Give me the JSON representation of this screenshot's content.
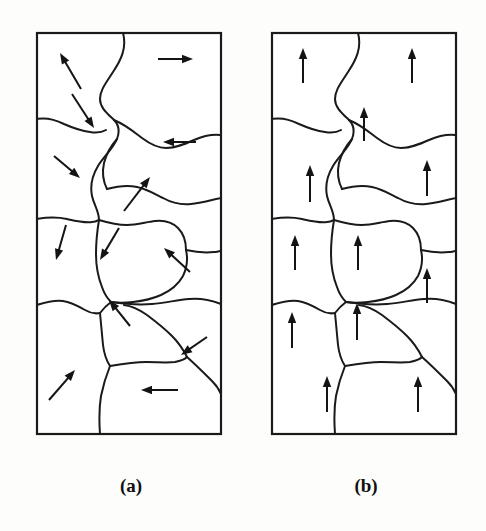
{
  "figure": {
    "background_color": "#fdfdfc",
    "line_color": "#1a1a1a",
    "arrow_color": "#141414",
    "width": 486,
    "height": 531
  },
  "panels": [
    {
      "id": "a",
      "caption": "(a)",
      "caption_x": 131,
      "caption_y": 492,
      "state": "randomly-oriented-domains",
      "frame": {
        "x": 37,
        "y": 33,
        "width": 184,
        "height": 401
      },
      "grain_boundaries": [
        "M 123 33 C 127 48, 121 60, 113 72 C 106 83, 100 90, 100 99 C 100 108, 108 114, 114 120 C 119 125, 120 131, 117 139 C 113 149, 104 156, 98 166 C 92 176, 90 186, 92 196 C 94 205, 99 211, 99 220",
        "M 37 119 C 48 117, 56 120, 64 124 C 73 128, 82 131, 90 132 C 96 133, 101 133, 106 130",
        "M 114 120 C 126 125, 134 132, 142 138 C 150 144, 158 148, 166 148 C 176 148, 185 144, 194 140 C 203 136, 212 134, 221 135",
        "M 117 139 C 110 147, 106 155, 104 163 C 102 172, 103 181, 107 189",
        "M 107 189 C 118 186, 128 185, 137 187 C 147 189, 155 194, 163 198 C 172 203, 181 205, 191 204 C 201 203, 211 200, 221 198",
        "M 37 219 C 48 217, 58 217, 67 219 C 76 221, 84 223, 92 222 C 95 222, 97 221, 99 220",
        "M 99 220 C 109 223, 118 225, 127 225 C 137 225, 146 222, 155 221 C 164 220, 172 222, 178 228 C 184 234, 186 242, 186 250",
        "M 186 250 C 195 252, 205 253, 214 252 C 217 252, 219 251, 221 251",
        "M 99 220 C 97 232, 96 243, 96 254 C 96 266, 98 277, 102 287 C 104 293, 107 298, 111 302",
        "M 186 250 C 188 259, 187 268, 183 276 C 178 285, 170 291, 161 295 C 152 299, 142 301, 133 302 C 125 303, 117 303, 111 302",
        "M 37 305 C 46 302, 55 300, 63 301 C 71 302, 78 306, 85 310 C 90 313, 95 314, 100 313",
        "M 100 313 C 103 309, 107 305, 111 302",
        "M 111 302 C 125 304, 139 305, 152 304 C 165 303, 177 300, 189 299 C 200 298, 211 300, 221 304",
        "M 100 313 C 101 324, 102 335, 103 345 C 104 353, 106 360, 110 366",
        "M 110 366 C 122 364, 134 362, 146 362 C 157 362, 167 363, 175 362 C 180 361, 184 360, 187 357",
        "M 187 357 C 183 349, 178 342, 172 336 C 164 328, 155 321, 147 315 C 140 310, 132 306, 124 305",
        "M 187 357 C 196 365, 204 373, 212 381 C 216 385, 219 389, 221 394",
        "M 110 366 C 106 376, 103 386, 101 396 C 99 408, 99 420, 100 434"
      ],
      "arrows": [
        {
          "id": "a1",
          "x1": 81,
          "y1": 89,
          "x2": 60,
          "y2": 53,
          "direction": "up-left"
        },
        {
          "id": "a2",
          "x1": 158,
          "y1": 59,
          "x2": 193,
          "y2": 59,
          "direction": "right"
        },
        {
          "id": "a3",
          "x1": 72,
          "y1": 94,
          "x2": 94,
          "y2": 128,
          "direction": "down-right"
        },
        {
          "id": "a4",
          "x1": 196,
          "y1": 142,
          "x2": 163,
          "y2": 142,
          "direction": "left"
        },
        {
          "id": "a5",
          "x1": 54,
          "y1": 156,
          "x2": 80,
          "y2": 178,
          "direction": "down-right"
        },
        {
          "id": "a6",
          "x1": 124,
          "y1": 211,
          "x2": 150,
          "y2": 177,
          "direction": "up-right"
        },
        {
          "id": "a7",
          "x1": 66,
          "y1": 225,
          "x2": 56,
          "y2": 260,
          "direction": "down-left"
        },
        {
          "id": "a8",
          "x1": 119,
          "y1": 228,
          "x2": 100,
          "y2": 260,
          "direction": "down-left"
        },
        {
          "id": "a9",
          "x1": 190,
          "y1": 272,
          "x2": 164,
          "y2": 248,
          "direction": "up-left"
        },
        {
          "id": "a10",
          "x1": 130,
          "y1": 326,
          "x2": 109,
          "y2": 300,
          "direction": "up-left"
        },
        {
          "id": "a11",
          "x1": 207,
          "y1": 337,
          "x2": 181,
          "y2": 355,
          "direction": "down-left"
        },
        {
          "id": "a12",
          "x1": 49,
          "y1": 400,
          "x2": 75,
          "y2": 370,
          "direction": "up-right"
        },
        {
          "id": "a13",
          "x1": 178,
          "y1": 390,
          "x2": 141,
          "y2": 390,
          "direction": "left"
        }
      ]
    },
    {
      "id": "b",
      "caption": "(b)",
      "caption_x": 366,
      "caption_y": 492,
      "state": "aligned-domains",
      "frame": {
        "x": 272,
        "y": 33,
        "width": 184,
        "height": 401
      },
      "grain_boundaries": [
        "M 358 33 C 362 48, 356 60, 348 72 C 341 83, 335 90, 335 99 C 335 108, 343 114, 349 120 C 354 125, 355 131, 352 139 C 348 149, 339 156, 333 166 C 327 176, 325 186, 327 196 C 329 205, 334 211, 334 220",
        "M 272 119 C 283 117, 291 120, 299 124 C 308 128, 317 131, 325 132 C 331 133, 336 133, 341 130",
        "M 349 120 C 361 125, 369 132, 377 138 C 385 144, 393 148, 401 148 C 411 148, 420 144, 429 140 C 438 136, 447 134, 456 135",
        "M 352 139 C 345 147, 341 155, 339 163 C 337 172, 338 181, 342 189",
        "M 342 189 C 353 186, 363 185, 372 187 C 382 189, 390 194, 398 198 C 407 203, 416 205, 426 204 C 436 203, 446 200, 456 198",
        "M 272 219 C 283 217, 293 217, 302 219 C 311 221, 319 223, 327 222 C 330 222, 332 221, 334 220",
        "M 334 220 C 344 223, 353 225, 362 225 C 372 225, 381 222, 390 221 C 399 220, 407 222, 413 228 C 419 234, 421 242, 421 250",
        "M 421 250 C 430 252, 440 253, 449 252 C 452 252, 454 251, 456 251",
        "M 334 220 C 332 232, 331 243, 331 254 C 331 266, 333 277, 337 287 C 339 293, 342 298, 346 302",
        "M 421 250 C 423 259, 422 268, 418 276 C 413 285, 405 291, 396 295 C 387 299, 377 301, 368 302 C 360 303, 352 303, 346 302",
        "M 272 305 C 281 302, 290 300, 298 301 C 306 302, 313 306, 320 310 C 325 313, 330 314, 335 313",
        "M 335 313 C 338 309, 342 305, 346 302",
        "M 346 302 C 360 304, 374 305, 387 304 C 400 303, 412 300, 424 299 C 435 298, 446 300, 456 304",
        "M 335 313 C 336 324, 337 335, 338 345 C 339 353, 341 360, 345 366",
        "M 345 366 C 357 364, 369 362, 381 362 C 392 362, 402 363, 410 362 C 415 361, 419 360, 422 357",
        "M 422 357 C 418 349, 413 342, 407 336 C 399 328, 390 321, 382 315 C 375 310, 367 306, 359 305",
        "M 422 357 C 431 365, 439 373, 447 381 C 451 385, 454 389, 456 394",
        "M 345 366 C 341 376, 338 386, 336 396 C 334 408, 334 420, 335 434"
      ],
      "arrows": [
        {
          "id": "b1",
          "x1": 303,
          "y1": 83,
          "x2": 303,
          "y2": 48,
          "direction": "up"
        },
        {
          "id": "b2",
          "x1": 412,
          "y1": 83,
          "x2": 412,
          "y2": 48,
          "direction": "up"
        },
        {
          "id": "b3",
          "x1": 364,
          "y1": 141,
          "x2": 364,
          "y2": 107,
          "direction": "up"
        },
        {
          "id": "b4",
          "x1": 310,
          "y1": 202,
          "x2": 310,
          "y2": 165,
          "direction": "up"
        },
        {
          "id": "b5",
          "x1": 427,
          "y1": 196,
          "x2": 427,
          "y2": 160,
          "direction": "up"
        },
        {
          "id": "b6",
          "x1": 295,
          "y1": 270,
          "x2": 295,
          "y2": 235,
          "direction": "up"
        },
        {
          "id": "b7",
          "x1": 358,
          "y1": 270,
          "x2": 358,
          "y2": 235,
          "direction": "up"
        },
        {
          "id": "b8",
          "x1": 427,
          "y1": 303,
          "x2": 427,
          "y2": 268,
          "direction": "up"
        },
        {
          "id": "b9",
          "x1": 292,
          "y1": 348,
          "x2": 292,
          "y2": 312,
          "direction": "up"
        },
        {
          "id": "b10",
          "x1": 357,
          "y1": 340,
          "x2": 357,
          "y2": 303,
          "direction": "up"
        },
        {
          "id": "b11",
          "x1": 327,
          "y1": 412,
          "x2": 327,
          "y2": 376,
          "direction": "up"
        },
        {
          "id": "b12",
          "x1": 418,
          "y1": 412,
          "x2": 418,
          "y2": 376,
          "direction": "up"
        }
      ]
    }
  ]
}
